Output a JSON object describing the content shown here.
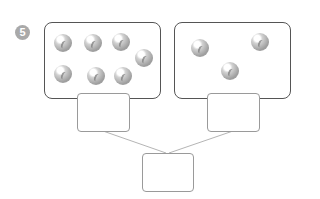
{
  "exercise": {
    "number": "5",
    "badge_color": "#a9a9a9"
  },
  "groups": [
    {
      "name": "left-group",
      "marble_count": 7
    },
    {
      "name": "right-group",
      "marble_count": 3
    }
  ],
  "answer_boxes": {
    "left": "",
    "right": "",
    "total": ""
  }
}
